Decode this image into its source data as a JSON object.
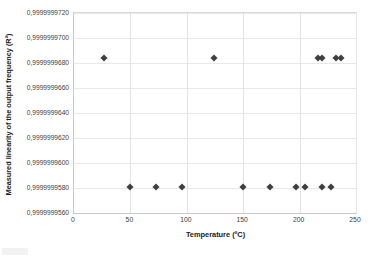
{
  "chart_data": {
    "type": "scatter",
    "title": "",
    "xlabel": "Temperature (ºC)",
    "ylabel": "Measured linearity of the output frequency  (R²)",
    "xlim": [
      0,
      250
    ],
    "ylim": [
      0.999999956,
      0.999999972
    ],
    "grid": true,
    "legend": false,
    "marker": "diamond",
    "marker_color": "#3f3f3f",
    "x_ticks": [
      "0",
      "50",
      "100",
      "150",
      "200",
      "250"
    ],
    "x_tick_values": [
      0,
      50,
      100,
      150,
      200,
      250
    ],
    "y_ticks": [
      "0,9999999720",
      "0,9999999700",
      "0,9999999680",
      "0,9999999660",
      "0,9999999640",
      "0,9999999620",
      "0,9999999600",
      "0,9999999580",
      "0,9999999560"
    ],
    "y_tick_values": [
      0.999999972,
      0.99999997,
      0.999999968,
      0.999999966,
      0.999999964,
      0.999999962,
      0.99999996,
      0.999999958,
      0.999999956
    ],
    "series": [
      {
        "name": "Measured linearity",
        "points": [
          {
            "x": 27,
            "y": 0.9999999684
          },
          {
            "x": 50,
            "y": 0.9999999581
          },
          {
            "x": 73,
            "y": 0.9999999581
          },
          {
            "x": 96,
            "y": 0.9999999581
          },
          {
            "x": 124,
            "y": 0.9999999684
          },
          {
            "x": 150,
            "y": 0.9999999581
          },
          {
            "x": 174,
            "y": 0.9999999581
          },
          {
            "x": 197,
            "y": 0.9999999581
          },
          {
            "x": 205,
            "y": 0.9999999581
          },
          {
            "x": 216,
            "y": 0.9999999684
          },
          {
            "x": 220,
            "y": 0.9999999684
          },
          {
            "x": 220,
            "y": 0.9999999581
          },
          {
            "x": 228,
            "y": 0.9999999581
          },
          {
            "x": 232,
            "y": 0.9999999684
          },
          {
            "x": 237,
            "y": 0.9999999684
          }
        ]
      }
    ]
  }
}
